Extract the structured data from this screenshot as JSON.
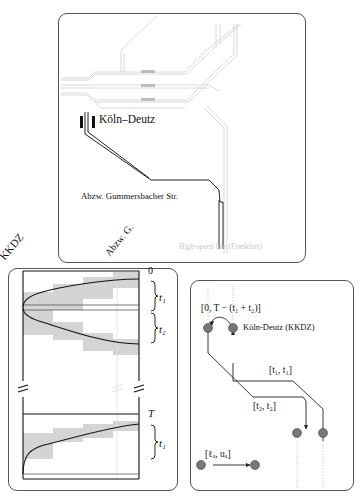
{
  "map_panel": {
    "station_label": "Köln–Deutz",
    "junction_label": "Abzw. Gummersbacher Str.",
    "faded_caption": "High-speed line (Frankfurt)"
  },
  "timespace_panel": {
    "col_labels": [
      "KKDZ",
      "Abzw. G."
    ],
    "time_top": "0",
    "time_bottom": "T",
    "brace_labels": [
      "t₁",
      "t₂",
      "t₁"
    ],
    "break_symbol": "//"
  },
  "network_panel": {
    "interval_top": "[0, T − (t₁ + t₂)]",
    "node_label": "Köln-Deutz (KKDZ)",
    "interval_t1": "[t₁, t₁]",
    "interval_t2": "[t₂, t₂]",
    "legend_interval": "[ℓₐ, uₐ]",
    "node_color": "#777777"
  }
}
